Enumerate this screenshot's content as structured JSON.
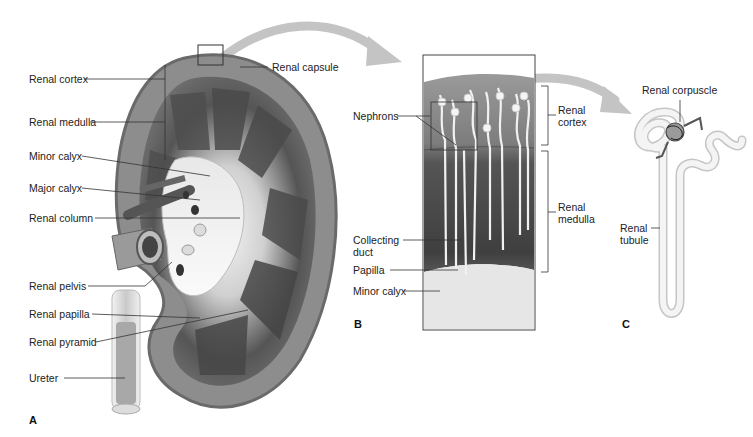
{
  "figure": {
    "panels": [
      {
        "id": "A",
        "letter": "A",
        "subject": "kidney-coronal-section",
        "labels": [
          "Renal cortex",
          "Renal medulla",
          "Minor calyx",
          "Major calyx",
          "Renal column",
          "Renal pelvis",
          "Renal papilla",
          "Renal pyramid",
          "Ureter",
          "Renal capsule"
        ]
      },
      {
        "id": "B",
        "letter": "B",
        "subject": "renal-pyramid-enlargement",
        "labels": [
          "Nephrons",
          "Collecting duct",
          "Papilla",
          "Minor calyx",
          "Renal cortex",
          "Renal medulla"
        ]
      },
      {
        "id": "C",
        "letter": "C",
        "subject": "single-nephron",
        "labels": [
          "Renal corpuscle",
          "Renal tubule"
        ]
      }
    ]
  },
  "colors": {
    "cortex": "#8a8a8a",
    "medulla_dark": "#4a4a4a",
    "pelvis_light": "#efefef",
    "arrow": "#b8b8b8",
    "leader_line": "#333333"
  }
}
